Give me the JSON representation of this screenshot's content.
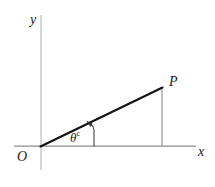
{
  "figure": {
    "type": "geometry-diagram",
    "background_color": "#ffffff",
    "width": 215,
    "height": 187,
    "axes": {
      "x_axis": {
        "label": "x",
        "color": "#8a8a8a",
        "start": [
          14,
          146
        ],
        "end": [
          196,
          146
        ]
      },
      "y_axis": {
        "label": "y",
        "color": "#b5b5b5",
        "start": [
          41,
          15
        ],
        "end": [
          41,
          170
        ]
      },
      "origin": {
        "label": "O",
        "position": [
          41,
          146
        ]
      }
    },
    "points": [
      {
        "label": "P",
        "position": [
          162,
          88
        ]
      }
    ],
    "segments": [
      {
        "name": "hypotenuse",
        "from": [
          41,
          146
        ],
        "to": [
          162,
          88
        ],
        "color": "#111111",
        "width": 2.1
      },
      {
        "name": "vertical-drop",
        "from": [
          162,
          88
        ],
        "to": [
          162,
          146
        ],
        "color": "#9a9a9a",
        "width": 1.2
      }
    ],
    "angle": {
      "label": "θ",
      "superscript": "c",
      "unit": "radians",
      "vertex": [
        41,
        146
      ],
      "arrow_base": [
        94,
        146
      ],
      "arrow_tip": [
        89,
        123
      ]
    }
  }
}
